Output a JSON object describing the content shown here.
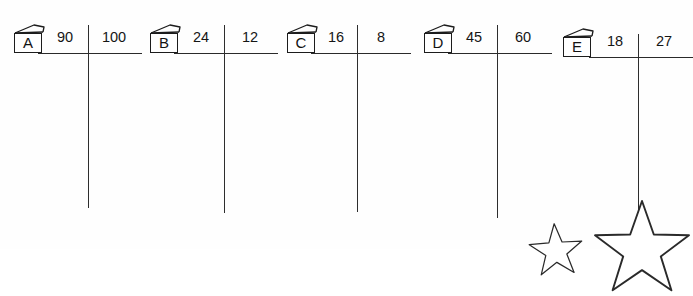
{
  "worksheet": {
    "title": "Long division setup worksheet",
    "ink_color": "#1c1c1c",
    "paper_color": "#fefefe",
    "groups": [
      {
        "id": "a",
        "label": "A",
        "icon": "book-icon",
        "left_number": "90",
        "right_number": "100",
        "icon_x": 14,
        "icon_y": 24,
        "rule_x": 38,
        "rule_w": 104,
        "rule_y": 53,
        "divider_x": 88,
        "divider_top": 25,
        "divider_bottom": 208,
        "left_num_x": 44,
        "left_num_w": 42,
        "right_num_x": 90,
        "right_num_w": 48
      },
      {
        "id": "b",
        "label": "B",
        "icon": "book-icon",
        "left_number": "24",
        "right_number": "12",
        "icon_x": 150,
        "icon_y": 24,
        "rule_x": 174,
        "rule_w": 104,
        "rule_y": 53,
        "divider_x": 224,
        "divider_top": 25,
        "divider_bottom": 213,
        "left_num_x": 180,
        "left_num_w": 42,
        "right_num_x": 226,
        "right_num_w": 48
      },
      {
        "id": "c",
        "label": "C",
        "icon": "book-icon",
        "left_number": "16",
        "right_number": "8",
        "icon_x": 287,
        "icon_y": 24,
        "rule_x": 311,
        "rule_w": 100,
        "rule_y": 53,
        "divider_x": 357,
        "divider_top": 25,
        "divider_bottom": 212,
        "left_num_x": 315,
        "left_num_w": 42,
        "right_num_x": 359,
        "right_num_w": 44
      },
      {
        "id": "d",
        "label": "D",
        "icon": "book-icon",
        "left_number": "45",
        "right_number": "60",
        "icon_x": 424,
        "icon_y": 24,
        "rule_x": 448,
        "rule_w": 104,
        "rule_y": 53,
        "divider_x": 497,
        "divider_top": 25,
        "divider_bottom": 218,
        "left_num_x": 453,
        "left_num_w": 42,
        "right_num_x": 499,
        "right_num_w": 48
      },
      {
        "id": "e",
        "label": "E",
        "icon": "book-icon",
        "left_number": "18",
        "right_number": "27",
        "icon_x": 563,
        "icon_y": 28,
        "rule_x": 589,
        "rule_w": 104,
        "rule_y": 57,
        "divider_x": 638,
        "divider_top": 34,
        "divider_bottom": 222,
        "left_num_x": 594,
        "left_num_w": 42,
        "right_num_x": 640,
        "right_num_w": 48
      }
    ],
    "decorations": [
      {
        "id": "star-small",
        "name": "star-outline-small",
        "x": 528,
        "y": 222,
        "size": 56,
        "rotation": -4
      },
      {
        "id": "star-large",
        "name": "star-outline-large",
        "x": 592,
        "y": 198,
        "size": 100,
        "rotation": 0
      }
    ]
  }
}
